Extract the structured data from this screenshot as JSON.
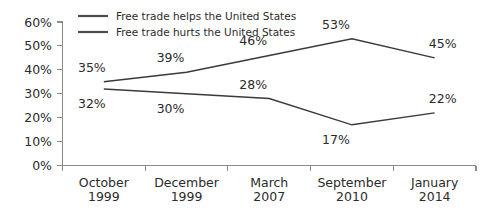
{
  "chart_data": {
    "type": "line",
    "title": "",
    "subtitle": "",
    "xlabel": "",
    "ylabel": "",
    "ylim": [
      0,
      60
    ],
    "ytick_labels": [
      "0%",
      "10%",
      "20%",
      "30%",
      "40%",
      "50%",
      "60%"
    ],
    "ytick_values": [
      0,
      10,
      20,
      30,
      40,
      50,
      60
    ],
    "grid": false,
    "legend_position": "top-inside",
    "categories": [
      "October\n1999",
      "December\n1999",
      "March\n2007",
      "September\n2010",
      "January\n2014"
    ],
    "category_lines": [
      [
        "October",
        "1999"
      ],
      [
        "December",
        "1999"
      ],
      [
        "March",
        "2007"
      ],
      [
        "September",
        "2010"
      ],
      [
        "January",
        "2014"
      ]
    ],
    "series": [
      {
        "name": "Free trade helps the United States",
        "color": "#3a3a3a",
        "values": [
          35,
          39,
          46,
          53,
          45
        ],
        "data_labels": [
          "35%",
          "39%",
          "46%",
          "53%",
          "45%"
        ],
        "label_positions": [
          "above",
          "above",
          "above",
          "above",
          "above"
        ]
      },
      {
        "name": "Free trade hurts the United States",
        "color": "#3a3a3a",
        "values": [
          32,
          30,
          28,
          17,
          22
        ],
        "data_labels": [
          "32%",
          "30%",
          "28%",
          "17%",
          "22%"
        ],
        "label_positions": [
          "below",
          "below",
          "above",
          "below",
          "above"
        ]
      }
    ]
  },
  "legend": {
    "items": [
      {
        "label": "Free trade helps the United States"
      },
      {
        "label": "Free trade hurts the United States"
      }
    ]
  },
  "axes": {
    "y_labels": [
      "60%",
      "50%",
      "40%",
      "30%",
      "20%",
      "10%",
      "0%"
    ],
    "x_labels_top": [
      "October",
      "December",
      "March",
      "September",
      "January"
    ],
    "x_labels_bottom": [
      "1999",
      "1999",
      "2007",
      "2010",
      "2014"
    ]
  },
  "colors": {
    "series_line": "#3a3a3a",
    "axis": "#8a8a8a",
    "text": "#2b2b2b",
    "background": "#ffffff"
  }
}
